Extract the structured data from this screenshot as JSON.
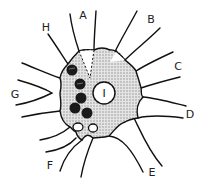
{
  "diagram": {
    "type": "cell-illustration",
    "labels": {
      "A": "A",
      "B": "B",
      "C": "C",
      "D": "D",
      "E": "E",
      "F": "F",
      "G": "G",
      "H": "H",
      "nucleus": "I"
    },
    "colors": {
      "outline": "#111111",
      "cell_fill": "#c8c8c8",
      "granules": "#1a1a1a",
      "nucleus_fill": "#ffffff",
      "background": "#ffffff"
    }
  }
}
